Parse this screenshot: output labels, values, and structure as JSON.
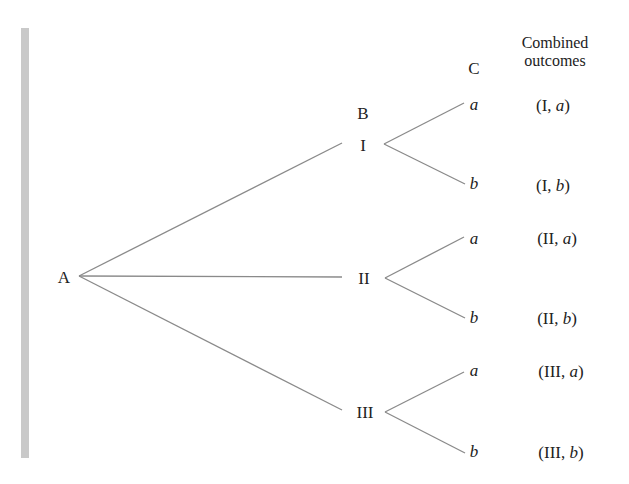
{
  "diagram": {
    "type": "tree-diagram",
    "headers": {
      "stage_b": "B",
      "stage_c": "C",
      "combined_line1": "Combined",
      "combined_line2": "outcomes"
    },
    "root": {
      "label": "A"
    },
    "stage_b_nodes": [
      {
        "label": "I"
      },
      {
        "label": "II"
      },
      {
        "label": "III"
      }
    ],
    "stage_c_nodes": [
      {
        "label": "a"
      },
      {
        "label": "b"
      },
      {
        "label": "a"
      },
      {
        "label": "b"
      },
      {
        "label": "a"
      },
      {
        "label": "b"
      }
    ],
    "outcomes": [
      {
        "prefix": "(I, ",
        "var": "a",
        "suffix": ")"
      },
      {
        "prefix": "(I, ",
        "var": "b",
        "suffix": ")"
      },
      {
        "prefix": "(II, ",
        "var": "a",
        "suffix": ")"
      },
      {
        "prefix": "(II, ",
        "var": "b",
        "suffix": ")"
      },
      {
        "prefix": "(III, ",
        "var": "a",
        "suffix": ")"
      },
      {
        "prefix": "(III, ",
        "var": "b",
        "suffix": ")"
      }
    ],
    "line_color": "#8a8a8a",
    "sidebar_color": "#c9c9c9"
  }
}
